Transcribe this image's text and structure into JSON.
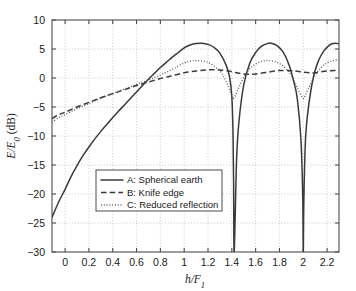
{
  "chart_data": {
    "type": "line",
    "title": "",
    "xlabel": "h/F_1",
    "xlabel_parts": {
      "base": "h/F",
      "sub": "1"
    },
    "ylabel": "E/E_0 (dB)",
    "ylabel_parts": {
      "num": "E/E",
      "sub": "0",
      "unit": " (dB)"
    },
    "xlim": [
      -0.11,
      2.3
    ],
    "ylim": [
      -30,
      10
    ],
    "xticks": [
      0,
      0.2,
      0.4,
      0.6,
      0.8,
      1,
      1.2,
      1.4,
      1.6,
      1.8,
      2,
      2.2
    ],
    "xticklabels": [
      "0",
      "0.2",
      "0.4",
      "0.6",
      "0.8",
      "1",
      "1.2",
      "1.4",
      "1.6",
      "1.8",
      "2",
      "2.2"
    ],
    "yticks": [
      -30,
      -25,
      -20,
      -15,
      -10,
      -5,
      0,
      5,
      10
    ],
    "yticklabels": [
      "-30",
      "-25",
      "-20",
      "-15",
      "-10",
      "-5",
      "0",
      "5",
      "10"
    ],
    "grid": true,
    "grid_style": "dotted",
    "legend_position": "lower center-left",
    "series": [
      {
        "name": "A: Spherical earth",
        "key": "A",
        "style": "solid",
        "color": "#3a3a3a",
        "x": [
          -0.11,
          -0.05,
          0.0,
          0.05,
          0.1,
          0.15,
          0.2,
          0.25,
          0.3,
          0.35,
          0.4,
          0.45,
          0.5,
          0.55,
          0.6,
          0.65,
          0.7,
          0.75,
          0.8,
          0.85,
          0.9,
          0.95,
          1.0,
          1.05,
          1.1,
          1.15,
          1.2,
          1.25,
          1.3,
          1.35,
          1.38,
          1.4,
          1.41,
          1.415,
          1.42,
          1.44,
          1.46,
          1.5,
          1.55,
          1.6,
          1.65,
          1.7,
          1.73,
          1.78,
          1.83,
          1.88,
          1.92,
          1.95,
          1.98,
          1.995,
          2.0,
          2.005,
          2.02,
          2.05,
          2.09,
          2.13,
          2.17,
          2.21,
          2.24,
          2.27,
          2.3
        ],
        "y": [
          -24.0,
          -21.2,
          -19.2,
          -17.0,
          -15.1,
          -13.4,
          -11.9,
          -10.5,
          -9.2,
          -8.0,
          -6.8,
          -5.7,
          -4.6,
          -3.5,
          -2.4,
          -1.3,
          -0.2,
          0.8,
          1.8,
          2.7,
          3.6,
          4.4,
          5.2,
          5.7,
          5.95,
          6.0,
          5.8,
          5.3,
          4.3,
          2.3,
          0.3,
          -3.2,
          -9.5,
          -18.0,
          -30.0,
          -14.0,
          -7.5,
          -1.2,
          2.5,
          4.4,
          5.5,
          5.95,
          6.0,
          5.6,
          4.5,
          2.3,
          -0.6,
          -3.6,
          -10.5,
          -20.0,
          -30.0,
          -21.0,
          -10.0,
          -4.0,
          0.6,
          3.1,
          4.6,
          5.5,
          5.9,
          6.0,
          5.9
        ]
      },
      {
        "name": "B: Knife edge",
        "key": "B",
        "style": "dashed",
        "color": "#3a3a3a",
        "x": [
          -0.11,
          -0.05,
          0.0,
          0.1,
          0.2,
          0.3,
          0.4,
          0.5,
          0.6,
          0.7,
          0.8,
          0.9,
          1.0,
          1.1,
          1.2,
          1.3,
          1.4,
          1.45,
          1.5,
          1.55,
          1.6,
          1.7,
          1.8,
          1.9,
          1.95,
          2.0,
          2.05,
          2.1,
          2.2,
          2.3
        ],
        "y": [
          -7.0,
          -6.3,
          -5.9,
          -5.0,
          -4.2,
          -3.4,
          -2.7,
          -2.0,
          -1.3,
          -0.7,
          -0.1,
          0.4,
          0.9,
          1.2,
          1.4,
          1.4,
          1.1,
          0.85,
          0.7,
          0.65,
          0.7,
          1.0,
          1.3,
          1.25,
          1.15,
          1.0,
          0.9,
          0.9,
          1.2,
          1.3
        ]
      },
      {
        "name": "C: Reduced reflection",
        "key": "C",
        "style": "dotted",
        "color": "#555555",
        "x": [
          -0.11,
          -0.05,
          0.0,
          0.1,
          0.2,
          0.3,
          0.4,
          0.5,
          0.6,
          0.7,
          0.8,
          0.9,
          1.0,
          1.05,
          1.1,
          1.2,
          1.3,
          1.35,
          1.4,
          1.41,
          1.43,
          1.46,
          1.5,
          1.55,
          1.6,
          1.65,
          1.7,
          1.75,
          1.8,
          1.85,
          1.9,
          1.95,
          1.99,
          2.0,
          2.01,
          2.05,
          2.1,
          2.15,
          2.2,
          2.25,
          2.3
        ],
        "y": [
          -7.6,
          -6.8,
          -6.3,
          -5.3,
          -4.4,
          -3.5,
          -2.7,
          -1.9,
          -1.1,
          -0.35,
          0.5,
          1.5,
          2.6,
          2.9,
          3.0,
          2.7,
          1.2,
          -0.5,
          -3.0,
          -3.6,
          -3.0,
          -1.6,
          0.1,
          1.6,
          2.4,
          2.85,
          3.0,
          2.9,
          2.5,
          1.7,
          0.4,
          -1.7,
          -3.3,
          -3.5,
          -3.3,
          -1.5,
          0.5,
          1.8,
          2.6,
          3.0,
          3.1
        ]
      }
    ]
  },
  "legend": {
    "entries": [
      {
        "label": "A: Spherical earth",
        "style": "solid"
      },
      {
        "label": "B: Knife edge",
        "style": "dashed"
      },
      {
        "label": "C: Reduced reflection",
        "style": "dotted"
      }
    ]
  }
}
